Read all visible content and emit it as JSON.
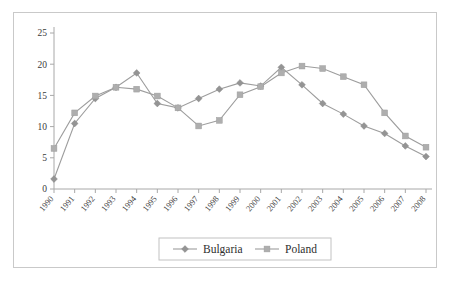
{
  "chart_data": {
    "type": "line",
    "title": "",
    "xlabel": "",
    "ylabel": "",
    "ylim": [
      0,
      25
    ],
    "yticks": [
      0,
      5,
      10,
      15,
      20,
      25
    ],
    "grid": false,
    "legend_position": "bottom",
    "categories": [
      "1990",
      "1991",
      "1992",
      "1993",
      "1994",
      "1995",
      "1996",
      "1997",
      "1998",
      "1999",
      "2000",
      "2001",
      "2002",
      "2003",
      "2004",
      "2005",
      "2006",
      "2007",
      "2008"
    ],
    "series": [
      {
        "name": "Bulgaria",
        "marker": "diamond",
        "color": "#949494",
        "values": [
          1.6,
          10.5,
          14.5,
          16.3,
          18.6,
          13.7,
          13.0,
          14.5,
          16.0,
          17.0,
          16.5,
          19.5,
          16.7,
          13.7,
          12.0,
          10.1,
          8.9,
          6.9,
          5.2
        ]
      },
      {
        "name": "Poland",
        "marker": "square",
        "color": "#aeaeae",
        "values": [
          6.5,
          12.2,
          14.9,
          16.3,
          16.0,
          14.9,
          13.0,
          10.1,
          11.0,
          15.1,
          16.4,
          18.6,
          19.7,
          19.3,
          18.0,
          16.7,
          12.2,
          8.5,
          6.7
        ]
      }
    ]
  },
  "legend": {
    "items": [
      {
        "label": "Bulgaria",
        "marker": "diamond-marker-icon"
      },
      {
        "label": "Poland",
        "marker": "square-marker-icon"
      }
    ]
  },
  "colors": {
    "axis": "#a8a8a8",
    "frame": "#c9c9c9",
    "bulgaria": "#949494",
    "poland": "#aeaeae",
    "text": "#3a3a3a",
    "background": "#ffffff"
  }
}
